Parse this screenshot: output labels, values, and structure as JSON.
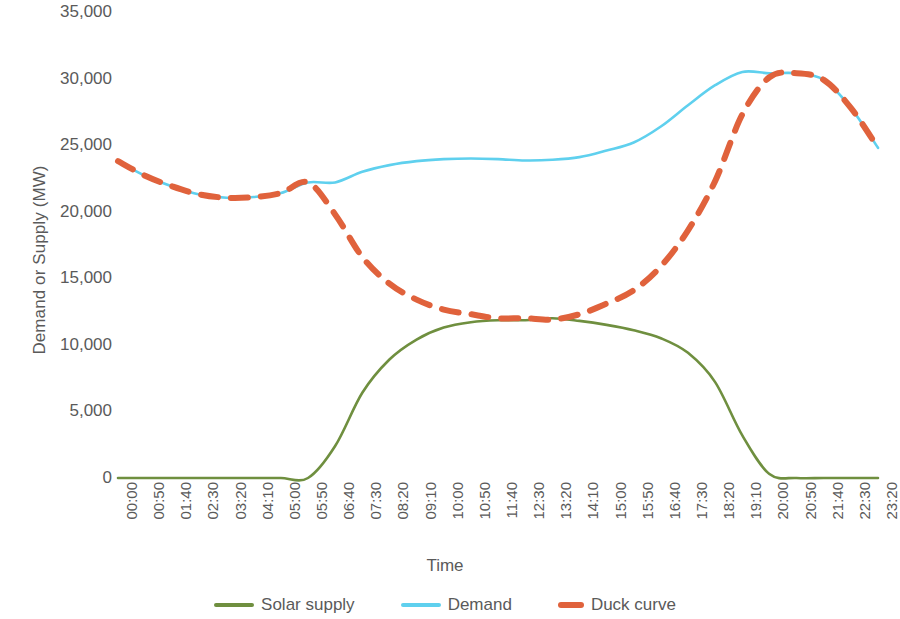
{
  "chart_data": {
    "type": "line",
    "title": "",
    "xlabel": "Time",
    "ylabel": "Demand or Supply (MW)",
    "ylim": [
      0,
      35000
    ],
    "ytick_labels": [
      "35,000",
      "30,000",
      "25,000",
      "20,000",
      "15,000",
      "10,000",
      "5,000",
      "0"
    ],
    "ytick_values": [
      35000,
      30000,
      25000,
      20000,
      15000,
      10000,
      5000,
      0
    ],
    "grid": false,
    "legend_position": "bottom",
    "x_tick_interval_minutes": 50,
    "categories": [
      "00:00",
      "00:50",
      "01:40",
      "02:30",
      "03:20",
      "04:10",
      "05:00",
      "05:50",
      "06:40",
      "07:30",
      "08:20",
      "09:10",
      "10:00",
      "10:50",
      "11:40",
      "12:30",
      "13:20",
      "14:10",
      "15:00",
      "15:50",
      "16:40",
      "17:30",
      "18:20",
      "19:10",
      "20:00",
      "20:50",
      "21:40",
      "22:30",
      "23:20"
    ],
    "series": [
      {
        "name": "Solar supply",
        "color": "#6F8F3F",
        "style": "solid",
        "values": [
          0,
          0,
          0,
          0,
          0,
          0,
          0,
          0,
          2400,
          6400,
          8900,
          10400,
          11300,
          11700,
          11850,
          11850,
          12000,
          11800,
          11500,
          11100,
          10500,
          9400,
          7200,
          3200,
          300,
          0,
          0,
          0,
          0
        ]
      },
      {
        "name": "Demand",
        "color": "#5FD0EE",
        "style": "solid",
        "values": [
          23800,
          22700,
          21900,
          21300,
          21050,
          21100,
          21400,
          22200,
          22200,
          23000,
          23500,
          23800,
          23950,
          24000,
          23950,
          23850,
          23900,
          24100,
          24600,
          25200,
          26400,
          28000,
          29500,
          30500,
          30400,
          30400,
          29900,
          27800,
          24800
        ]
      },
      {
        "name": "Duck curve",
        "color": "#E0623C",
        "style": "dashed",
        "values": [
          23800,
          22700,
          21900,
          21300,
          21050,
          21100,
          21400,
          22200,
          19800,
          16600,
          14600,
          13400,
          12650,
          12300,
          12000,
          12000,
          11900,
          12300,
          13100,
          14100,
          15900,
          18600,
          22300,
          27300,
          30100,
          30400,
          29900,
          27800,
          24800
        ]
      }
    ]
  },
  "legend": {
    "items": [
      {
        "label": "Solar supply",
        "color": "#6F8F3F",
        "style": "solid"
      },
      {
        "label": "Demand",
        "color": "#5FD0EE",
        "style": "solid"
      },
      {
        "label": "Duck curve",
        "color": "#E0623C",
        "style": "dashed"
      }
    ]
  }
}
